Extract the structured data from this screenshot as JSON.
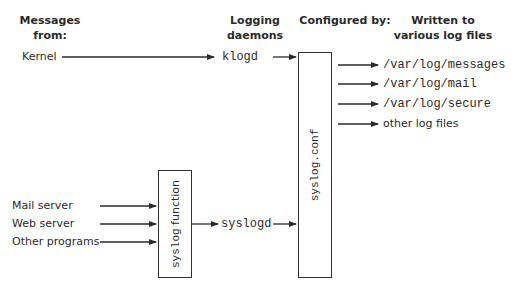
{
  "headers": {
    "messages_from": [
      "Messages",
      "from:"
    ],
    "logging_daemons": [
      "Logging",
      "daemons"
    ],
    "configured_by": [
      "Configured by:"
    ],
    "written_to": [
      "Written to",
      "various log files"
    ]
  },
  "sources": {
    "kernel": "Kernel",
    "mail_server": "Mail server",
    "web_server": "Web server",
    "other_programs": "Other programs"
  },
  "components": {
    "syslog_function": "syslog function",
    "syslog_conf": "syslog.conf"
  },
  "daemons": {
    "klogd": "klogd",
    "syslogd": "syslogd"
  },
  "outputs": [
    "/var/log/messages",
    "/var/log/mail",
    "/var/log/secure",
    "other log files"
  ],
  "colors": {
    "line": "#2a2a2a",
    "text": "#2a2a2a",
    "background": "#ffffff"
  }
}
